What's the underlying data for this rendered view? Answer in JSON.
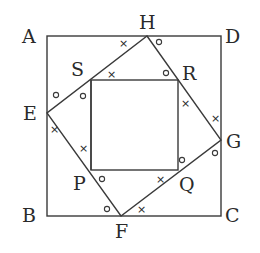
{
  "diagram": {
    "type": "geometry-figure",
    "outer_square": [
      "A",
      "D",
      "C",
      "B"
    ],
    "middle_square": [
      "H",
      "G",
      "F",
      "E"
    ],
    "inner_square": [
      "S",
      "R",
      "Q",
      "P"
    ],
    "labels": {
      "A": "A",
      "B": "B",
      "C": "C",
      "D": "D",
      "E": "E",
      "F": "F",
      "G": "G",
      "H": "H",
      "P": "P",
      "Q": "Q",
      "R": "R",
      "S": "S"
    },
    "angle_marks": {
      "circle": "○",
      "cross": "×"
    },
    "colors": {
      "line": "#3a3a3a",
      "text": "#2a2a2a",
      "background": "#ffffff"
    }
  }
}
